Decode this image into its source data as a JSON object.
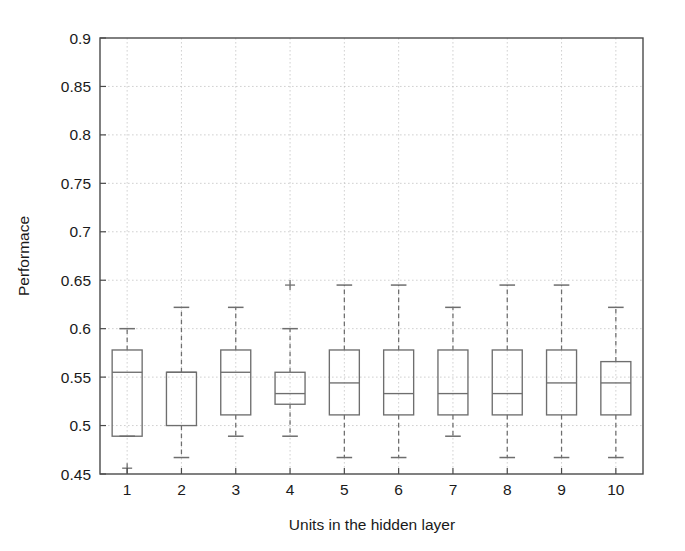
{
  "chart_data": {
    "type": "box",
    "title": "",
    "xlabel": "Units in the hidden layer",
    "ylabel": "Performace",
    "categories": [
      "1",
      "2",
      "3",
      "4",
      "5",
      "6",
      "7",
      "8",
      "9",
      "10"
    ],
    "xlim": [
      0.5,
      10.5
    ],
    "ylim": [
      0.45,
      0.9
    ],
    "yticks": [
      0.45,
      0.5,
      0.55,
      0.6,
      0.65,
      0.7,
      0.75,
      0.8,
      0.85,
      0.9
    ],
    "ytick_labels": [
      "0.45",
      "0.5",
      "0.55",
      "0.6",
      "0.65",
      "0.7",
      "0.75",
      "0.8",
      "0.85",
      "0.9"
    ],
    "grid": true,
    "legend": null,
    "boxes": [
      {
        "category": "1",
        "whisker_low": 0.489,
        "q1": 0.489,
        "median": 0.555,
        "q3": 0.578,
        "whisker_high": 0.6,
        "outliers": [
          0.456
        ]
      },
      {
        "category": "2",
        "whisker_low": 0.467,
        "q1": 0.5,
        "median": 0.555,
        "q3": 0.555,
        "whisker_high": 0.622,
        "outliers": []
      },
      {
        "category": "3",
        "whisker_low": 0.489,
        "q1": 0.511,
        "median": 0.555,
        "q3": 0.578,
        "whisker_high": 0.622,
        "outliers": []
      },
      {
        "category": "4",
        "whisker_low": 0.489,
        "q1": 0.522,
        "median": 0.533,
        "q3": 0.555,
        "whisker_high": 0.6,
        "outliers": [
          0.645
        ]
      },
      {
        "category": "5",
        "whisker_low": 0.467,
        "q1": 0.511,
        "median": 0.544,
        "q3": 0.578,
        "whisker_high": 0.645,
        "outliers": []
      },
      {
        "category": "6",
        "whisker_low": 0.467,
        "q1": 0.511,
        "median": 0.533,
        "q3": 0.578,
        "whisker_high": 0.645,
        "outliers": []
      },
      {
        "category": "7",
        "whisker_low": 0.489,
        "q1": 0.511,
        "median": 0.533,
        "q3": 0.578,
        "whisker_high": 0.622,
        "outliers": []
      },
      {
        "category": "8",
        "whisker_low": 0.467,
        "q1": 0.511,
        "median": 0.533,
        "q3": 0.578,
        "whisker_high": 0.645,
        "outliers": []
      },
      {
        "category": "9",
        "whisker_low": 0.467,
        "q1": 0.511,
        "median": 0.544,
        "q3": 0.578,
        "whisker_high": 0.645,
        "outliers": []
      },
      {
        "category": "10",
        "whisker_low": 0.467,
        "q1": 0.511,
        "median": 0.544,
        "q3": 0.566,
        "whisker_high": 0.622,
        "outliers": []
      }
    ],
    "colors": {
      "box_stroke": "#6e6e6e",
      "median_stroke": "#6e6e6e",
      "whisker_stroke": "#6e6e6e",
      "axis_stroke": "#4a4a4a",
      "grid_stroke": "#bdbdbd",
      "text": "#1a1a1a",
      "background": "#ffffff"
    }
  },
  "layout": {
    "plot_left": 100,
    "plot_right": 643,
    "plot_top": 38,
    "plot_bottom": 474,
    "box_width": 30
  }
}
